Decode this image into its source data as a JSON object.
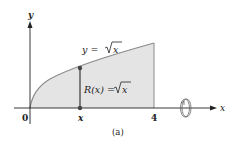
{
  "figure": {
    "caption": "(a)",
    "axes": {
      "x_label": "x",
      "y_label": "y",
      "origin_label": "0",
      "x_tick_labels": [
        "x",
        "4"
      ]
    },
    "curve": {
      "equation_lhs": "y = ",
      "equation_rhs": "x",
      "function": "sqrt(x)",
      "domain": [
        0,
        4
      ]
    },
    "radius": {
      "label_lhs": "R(x) = ",
      "label_rhs": "x"
    },
    "revolution_icon": "rotation-about-x-axis-icon",
    "colors": {
      "region_fill": "#e4e4e4",
      "curve_stroke": "#8a8a8a",
      "axis_stroke": "#222222",
      "point_fill": "#444444"
    }
  }
}
